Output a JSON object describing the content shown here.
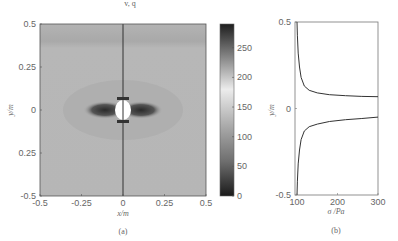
{
  "top_fragment": "v, q",
  "chart_data": [
    {
      "type": "heatmap",
      "panel": "(a)",
      "title": "",
      "xlabel": "x/m",
      "ylabel": "y/m",
      "xlim": [
        -0.5,
        0.5
      ],
      "ylim": [
        -0.5,
        0.5
      ],
      "xticks": [
        -0.5,
        -0.25,
        0,
        0.25,
        0.5
      ],
      "xtick_labels": [
        "-0.5",
        "-0.25",
        "0",
        "0.25",
        "0.5"
      ],
      "yticks": [
        0.5,
        0.25,
        0,
        -0.25,
        -0.5
      ],
      "ytick_labels": [
        "0.5",
        "0.25",
        "0",
        "0.25",
        "-0.5"
      ],
      "colorbar": {
        "range": [
          0,
          290
        ],
        "ticks": [
          0,
          50,
          100,
          150,
          200,
          250
        ],
        "tick_labels": [
          "0",
          "50",
          "100",
          "150",
          "200",
          "250"
        ],
        "colormap": "dark-gray-light-gray-dark (diverging grayscale)"
      },
      "features": {
        "background_value": 130,
        "center_hole": {
          "x": 0,
          "y": 0,
          "radius": 0.035,
          "value": "blank"
        },
        "high_lobes": [
          {
            "x": -0.08,
            "y": 0,
            "value": 40
          },
          {
            "x": 0.08,
            "y": 0,
            "value": 40
          }
        ],
        "vertical_line": {
          "x": 0
        }
      },
      "grid": false
    },
    {
      "type": "line",
      "panel": "(b)",
      "xlabel": "σ /Pa",
      "ylabel": "y/m",
      "xlim": [
        95,
        300
      ],
      "ylim": [
        -0.5,
        0.5
      ],
      "xticks": [
        100,
        200,
        300
      ],
      "xtick_labels": [
        "100",
        "200",
        "300"
      ],
      "yticks": [
        0.5,
        0,
        -0.5
      ],
      "ytick_labels": [
        "0.5",
        "0",
        "-0.5"
      ],
      "series": [
        {
          "name": "upper",
          "x": [
            100,
            101,
            103,
            106,
            110,
            118,
            130,
            150,
            180,
            220,
            260,
            300
          ],
          "y": [
            0.5,
            0.42,
            0.32,
            0.24,
            0.18,
            0.13,
            0.105,
            0.09,
            0.08,
            0.074,
            0.07,
            0.068
          ]
        },
        {
          "name": "lower",
          "x": [
            100,
            101,
            103,
            106,
            110,
            118,
            130,
            150,
            180,
            220,
            260,
            300
          ],
          "y": [
            -0.5,
            -0.42,
            -0.32,
            -0.24,
            -0.18,
            -0.13,
            -0.105,
            -0.09,
            -0.075,
            -0.065,
            -0.058,
            -0.05
          ]
        }
      ],
      "grid": false
    }
  ]
}
